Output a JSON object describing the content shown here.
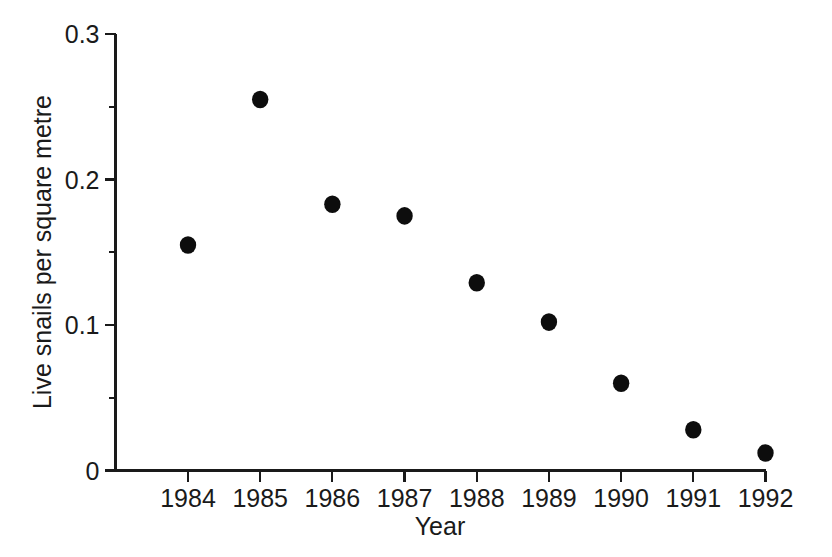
{
  "chart_data": {
    "type": "scatter",
    "title": "",
    "xlabel": "Year",
    "ylabel": "Live snails per square metre",
    "x": [
      1984,
      1985,
      1986,
      1987,
      1988,
      1989,
      1990,
      1991,
      1992
    ],
    "values": [
      0.155,
      0.255,
      0.183,
      0.175,
      0.129,
      0.102,
      0.06,
      0.028,
      0.012
    ],
    "categories": [
      "1984",
      "1985",
      "1986",
      "1987",
      "1988",
      "1989",
      "1990",
      "1991",
      "1992"
    ],
    "series": [
      {
        "name": "Live snails per square metre",
        "values": [
          0.155,
          0.255,
          0.183,
          0.175,
          0.129,
          0.102,
          0.06,
          0.028,
          0.012
        ]
      }
    ],
    "xlim": [
      1983.5,
      1992.5
    ],
    "ylim": [
      0,
      0.3
    ],
    "x_tick_labels": [
      "1984",
      "1985",
      "1986",
      "1987",
      "1988",
      "1989",
      "1990",
      "1991",
      "1992"
    ],
    "y_tick_labels": [
      "0",
      "0.1",
      "0.2",
      "0.3"
    ],
    "y_major_ticks": [
      0,
      0.1,
      0.2,
      0.3
    ],
    "y_minor_ticks": [
      0.05,
      0.15,
      0.25
    ],
    "grid": false,
    "legend": false,
    "legend_position": "none",
    "marker": "filled-circle",
    "marker_color": "#0d0d0d",
    "axis_color": "#1a1a1a",
    "background_color": "#ffffff"
  },
  "axes": {
    "y_title": "Live snails per square metre",
    "x_title": "Year"
  }
}
